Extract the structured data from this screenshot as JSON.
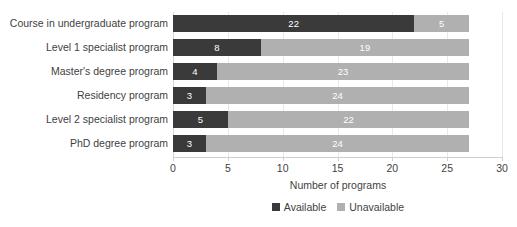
{
  "chart_data": {
    "type": "bar",
    "subtype": "stacked-horizontal-bar",
    "title": "",
    "xlabel": "Number of programs",
    "ylabel": "",
    "xlim": [
      0,
      30
    ],
    "xticks": [
      0,
      5,
      10,
      15,
      20,
      25,
      30
    ],
    "grid": true,
    "grid_axis": "x",
    "legend_position": "bottom-center",
    "categories": [
      "Course in undergraduate program",
      "Level 1 specialist program",
      "Master's degree program",
      "Residency program",
      "Level 2 specialist program",
      "PhD degree program"
    ],
    "series": [
      {
        "name": "Available",
        "color": "#3a3a3a",
        "values": [
          22,
          8,
          4,
          3,
          5,
          3
        ]
      },
      {
        "name": "Unavailable",
        "color": "#b0b0b0",
        "values": [
          5,
          19,
          23,
          24,
          22,
          24
        ]
      }
    ],
    "totals": [
      27,
      27,
      27,
      27,
      27,
      27
    ],
    "bar_labels": [
      [
        "22",
        "5"
      ],
      [
        "8",
        "19"
      ],
      [
        "4",
        "23"
      ],
      [
        "3",
        "24"
      ],
      [
        "5",
        "22"
      ],
      [
        "3",
        "24"
      ]
    ]
  },
  "axis": {
    "x_title": "Number of programs",
    "tick_labels": [
      "0",
      "5",
      "10",
      "15",
      "20",
      "25",
      "30"
    ]
  },
  "legend": {
    "items": [
      {
        "label": "Available",
        "color": "#3a3a3a"
      },
      {
        "label": "Unavailable",
        "color": "#b0b0b0"
      }
    ]
  },
  "colors": {
    "available": "#3a3a3a",
    "unavailable": "#b0b0b0",
    "gridline": "#e9e9e9",
    "axis": "#cfcfcf",
    "text": "#3f3f3f",
    "background": "#ffffff"
  }
}
